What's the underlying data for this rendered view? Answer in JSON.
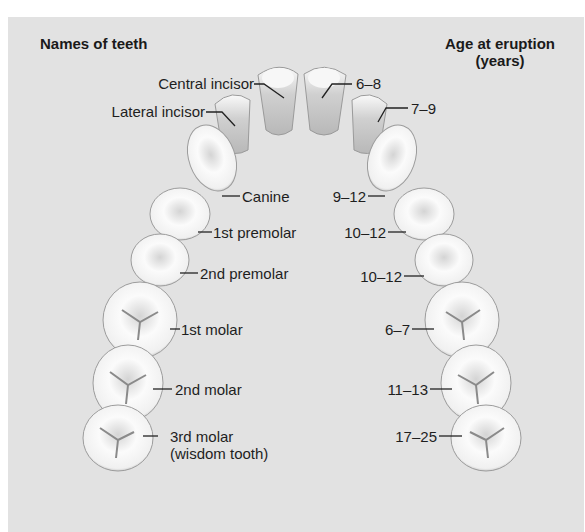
{
  "diagram": {
    "title_left": "Names of teeth",
    "title_right_line1": "Age at eruption",
    "title_right_line2": "(years)",
    "background_color": "#e2e2e2",
    "teeth": [
      {
        "name": "Central incisor",
        "eruption_age": "6–8"
      },
      {
        "name": "Lateral incisor",
        "eruption_age": "7–9"
      },
      {
        "name": "Canine",
        "eruption_age": "9–12"
      },
      {
        "name": "1st premolar",
        "eruption_age": "10–12"
      },
      {
        "name": "2nd premolar",
        "eruption_age": "10–12"
      },
      {
        "name": "1st molar",
        "eruption_age": "6–7"
      },
      {
        "name": "2nd molar",
        "eruption_age": "11–13"
      },
      {
        "name": "3rd molar",
        "name_line2": "(wisdom tooth)",
        "eruption_age": "17–25"
      }
    ]
  }
}
